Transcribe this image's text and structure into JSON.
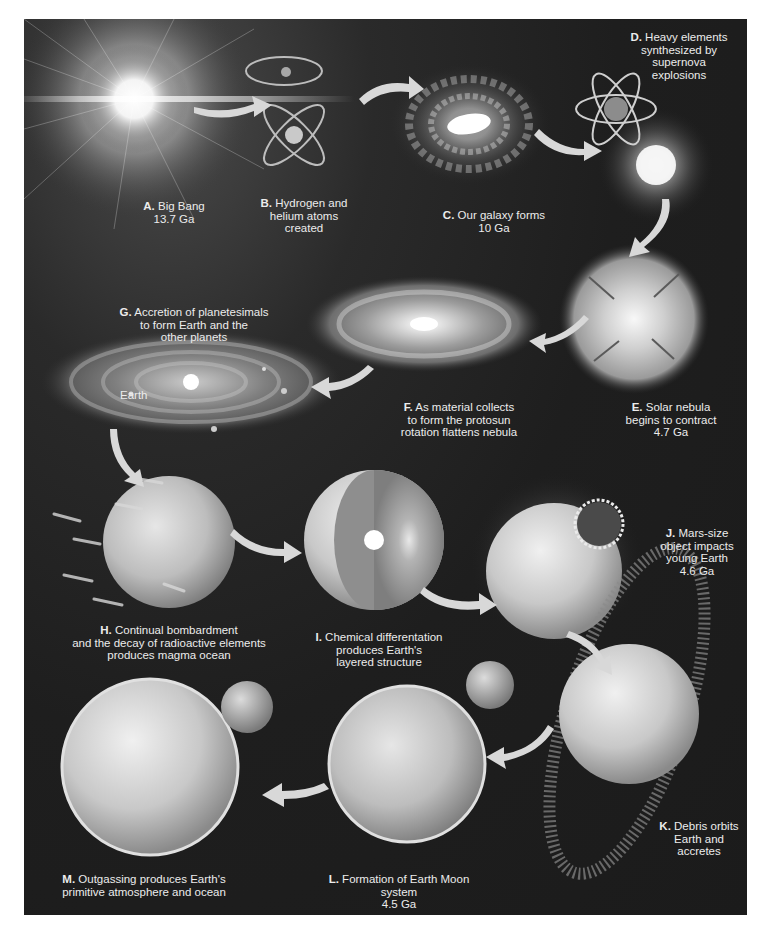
{
  "figure": {
    "colors": {
      "background": "#ffffff",
      "panel": "#1f1f1f",
      "label_text": "#ececec",
      "arrow": "#d8d8d8"
    },
    "stages": [
      {
        "id": "A",
        "letter": "A.",
        "text": "Big Bang\n13.7 Ga",
        "icon": "big-bang-flash"
      },
      {
        "id": "B",
        "letter": "B.",
        "text": "Hydrogen and\nhelium atoms\ncreated",
        "icon": "atom-orbits"
      },
      {
        "id": "C",
        "letter": "C.",
        "text": "Our galaxy forms\n10 Ga",
        "icon": "spiral-galaxy"
      },
      {
        "id": "D",
        "letter": "D.",
        "text": "Heavy elements\nsynthesized by\nsupernova\nexplosions",
        "icon": "supernova-atom"
      },
      {
        "id": "E",
        "letter": "E.",
        "text": "Solar nebula\nbegins to contract\n4.7 Ga",
        "icon": "contracting-nebula"
      },
      {
        "id": "F",
        "letter": "F.",
        "text": "As material collects\nto form the protosun\nrotation flattens nebula",
        "icon": "flattened-disk"
      },
      {
        "id": "G",
        "letter": "G.",
        "text": "Accretion of planetesimals\nto form Earth and the\nother planets",
        "icon": "planetary-disk",
        "sublabel": "Earth"
      },
      {
        "id": "H",
        "letter": "H.",
        "text": "Continual bombardment\nand the decay of radioactive elements\nproduces magma ocean",
        "icon": "bombarded-planet"
      },
      {
        "id": "I",
        "letter": "I.",
        "text": "Chemical differentation\nproduces Earth's\nlayered structure",
        "icon": "layered-earth-cutaway"
      },
      {
        "id": "J",
        "letter": "J.",
        "text": "Mars-size\nobject impacts\nyoung Earth\n4.6 Ga",
        "icon": "impact-planet"
      },
      {
        "id": "K",
        "letter": "K.",
        "text": "Debris orbits\nEarth and\naccretes",
        "icon": "debris-ring-planet"
      },
      {
        "id": "L",
        "letter": "L.",
        "text": "Formation of Earth Moon system\n4.5 Ga",
        "icon": "earth-moon-system"
      },
      {
        "id": "M",
        "letter": "M.",
        "text": "Outgassing produces Earth's\nprimitive atmosphere and ocean",
        "icon": "earth-atmosphere"
      }
    ]
  }
}
